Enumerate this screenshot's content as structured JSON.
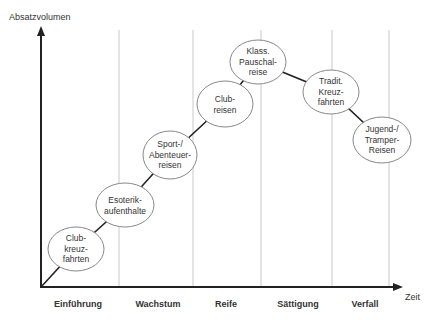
{
  "axes": {
    "y_label": "Absatzvolumen",
    "x_label": "Zeit"
  },
  "phases": [
    {
      "label": "Einführung",
      "x": 78
    },
    {
      "label": "Wachstum",
      "x": 158
    },
    {
      "label": "Reife",
      "x": 226
    },
    {
      "label": "Sättigung",
      "x": 298
    },
    {
      "label": "Verfall",
      "x": 365
    }
  ],
  "dividers_x": [
    119,
    193,
    261,
    332,
    389
  ],
  "nodes": [
    {
      "lines": [
        "Club-",
        "kreuz-",
        "fahrten"
      ],
      "cx": 76,
      "cy": 249,
      "rx": 28,
      "ry": 22
    },
    {
      "lines": [
        "Esoterik-",
        "aufenthalte"
      ],
      "cx": 125,
      "cy": 205,
      "rx": 29,
      "ry": 22
    },
    {
      "lines": [
        "Sport-/",
        "Abenteuer-",
        "reisen"
      ],
      "cx": 170,
      "cy": 155,
      "rx": 27,
      "ry": 24
    },
    {
      "lines": [
        "Club-",
        "reisen"
      ],
      "cx": 225,
      "cy": 104,
      "rx": 28,
      "ry": 23
    },
    {
      "lines": [
        "Klass.",
        "Pauschal-",
        "reise"
      ],
      "cx": 258,
      "cy": 62,
      "rx": 28,
      "ry": 22
    },
    {
      "lines": [
        "Tradit.",
        "Kreuz-",
        "fahrten"
      ],
      "cx": 331,
      "cy": 92,
      "rx": 28,
      "ry": 22
    },
    {
      "lines": [
        "Jugend-/",
        "Tramper-",
        "Reisen"
      ],
      "cx": 382,
      "cy": 140,
      "rx": 29,
      "ry": 23
    }
  ],
  "colors": {
    "axis": "#222222",
    "divider": "#c8c8c8",
    "ellipse_stroke": "#888888",
    "text": "#333333"
  }
}
